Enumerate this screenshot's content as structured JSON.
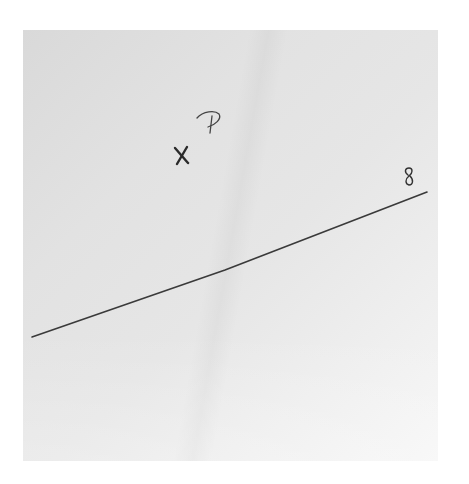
{
  "scene": {
    "description": "Photo of a sheet of paper with a hand-drawn line and a marked point",
    "paper_color": "#e4e4e4",
    "ink_color": "#3a3a3a"
  },
  "point": {
    "mark": "x",
    "label": "P",
    "position": [
      181,
      155
    ]
  },
  "line": {
    "label": "g",
    "start": [
      32,
      337
    ],
    "kink": [
      225,
      270
    ],
    "end": [
      427,
      192
    ]
  }
}
